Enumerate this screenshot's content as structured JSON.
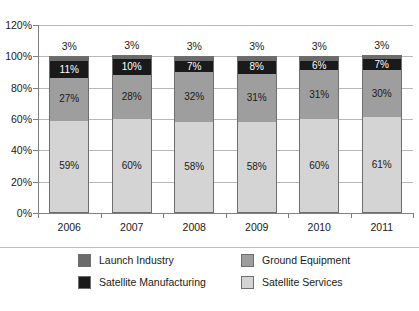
{
  "chart_data": {
    "type": "bar",
    "stacked": true,
    "title": "",
    "subtitle": "",
    "xlabel": "",
    "ylabel": "",
    "categories": [
      "2006",
      "2007",
      "2008",
      "2009",
      "2010",
      "2011"
    ],
    "ylim": [
      0,
      120
    ],
    "ytick_values": [
      0,
      20,
      40,
      60,
      80,
      100,
      120
    ],
    "ytick_labels": [
      "0%",
      "20%",
      "40%",
      "60%",
      "80%",
      "100%",
      "120%"
    ],
    "grid": true,
    "legend_position": "bottom",
    "stack_order_bottom_to_top": [
      "Satellite Services",
      "Ground Equipment",
      "Satellite Manufacturing",
      "Launch Industry"
    ],
    "series": [
      {
        "name": "Satellite Services",
        "color": "#d4d4d4",
        "label_color": "dark",
        "values": [
          59,
          60,
          58,
          58,
          60,
          61
        ],
        "value_labels": [
          "59%",
          "60%",
          "58%",
          "58%",
          "60%",
          "61%"
        ],
        "labels_outside": false
      },
      {
        "name": "Ground Equipment",
        "color": "#9e9e9e",
        "label_color": "dark",
        "values": [
          27,
          28,
          32,
          31,
          31,
          30
        ],
        "value_labels": [
          "27%",
          "28%",
          "32%",
          "31%",
          "31%",
          "30%"
        ],
        "labels_outside": false
      },
      {
        "name": "Satellite Manufacturing",
        "color": "#1a1a1a",
        "label_color": "light",
        "values": [
          11,
          10,
          7,
          8,
          6,
          7
        ],
        "value_labels": [
          "11%",
          "10%",
          "7%",
          "8%",
          "6%",
          "7%"
        ],
        "labels_outside": false
      },
      {
        "name": "Launch Industry",
        "color": "#6b6b6b",
        "label_color": "dark",
        "values": [
          3,
          3,
          3,
          3,
          3,
          3
        ],
        "value_labels": [
          "3%",
          "3%",
          "3%",
          "3%",
          "3%",
          "3%"
        ],
        "labels_outside": true
      }
    ]
  },
  "legend": {
    "items": [
      {
        "label": "Launch Industry",
        "color": "#6b6b6b"
      },
      {
        "label": "Ground Equipment",
        "color": "#9e9e9e"
      },
      {
        "label": "Satellite Manufacturing",
        "color": "#1a1a1a"
      },
      {
        "label": "Satellite Services",
        "color": "#d4d4d4"
      }
    ]
  },
  "colors": {
    "axis": "#808080",
    "gridline": "#b8b8b8",
    "background": "#ffffff",
    "text": "#1a1a1a"
  }
}
